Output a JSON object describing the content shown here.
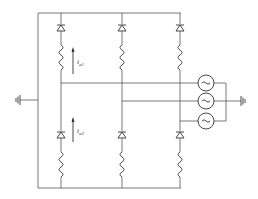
{
  "diagram": {
    "type": "circuit-schematic",
    "labels": {
      "current_upper": {
        "base": "i",
        "sub": "a1"
      },
      "current_lower": {
        "base": "i",
        "sub": "a2"
      }
    },
    "components": {
      "diodes": 6,
      "inductors": 6,
      "ac_sources": 3,
      "grounds": 2
    },
    "colors": {
      "wire": "#555555",
      "component": "#333333",
      "background": "#ffffff"
    }
  }
}
